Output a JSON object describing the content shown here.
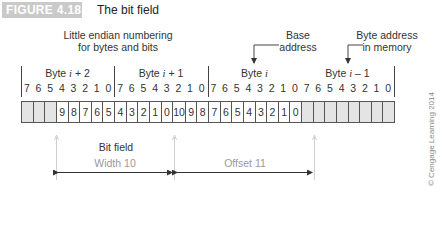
{
  "header": {
    "figure_label": "FIGURE 4.18",
    "title": "The bit field",
    "badge_color": "#c9c9c9"
  },
  "annotations": {
    "numbering_note_line1": "Little endian numbering",
    "numbering_note_line2": "for bytes and bits",
    "base_address_line1": "Base",
    "base_address_line2": "address",
    "byte_address_line1": "Byte address",
    "byte_address_line2": "in memory",
    "bit_field_label": "Bit field",
    "width_label": "Width 10",
    "offset_label": "Offset 11",
    "copyright": "© Cengage Learning 2014"
  },
  "bytes": [
    {
      "prefix": "Byte ",
      "var": "i",
      "suffix": " + 2"
    },
    {
      "prefix": "Byte ",
      "var": "i",
      "suffix": " + 1"
    },
    {
      "prefix": "Byte ",
      "var": "i",
      "suffix": ""
    },
    {
      "prefix": "Byte ",
      "var": "i",
      "suffix": " – 1"
    }
  ],
  "bit_numbers": [
    "7",
    "6",
    "5",
    "4",
    "3",
    "2",
    "1",
    "0",
    "7",
    "6",
    "5",
    "4",
    "3",
    "2",
    "1",
    "0",
    "7",
    "6",
    "5",
    "4",
    "3",
    "2",
    "1",
    "0",
    "7",
    "6",
    "5",
    "4",
    "3",
    "2",
    "1",
    "0"
  ],
  "cells": [
    {
      "v": "",
      "shaded": true
    },
    {
      "v": "",
      "shaded": true
    },
    {
      "v": "",
      "shaded": true
    },
    {
      "v": "9",
      "shaded": false
    },
    {
      "v": "8",
      "shaded": false
    },
    {
      "v": "7",
      "shaded": false
    },
    {
      "v": "6",
      "shaded": false
    },
    {
      "v": "5",
      "shaded": false
    },
    {
      "v": "4",
      "shaded": false
    },
    {
      "v": "3",
      "shaded": false
    },
    {
      "v": "2",
      "shaded": false
    },
    {
      "v": "1",
      "shaded": false
    },
    {
      "v": "0",
      "shaded": false
    },
    {
      "v": "10",
      "shaded": false
    },
    {
      "v": "9",
      "shaded": false
    },
    {
      "v": "8",
      "shaded": false
    },
    {
      "v": "7",
      "shaded": false
    },
    {
      "v": "6",
      "shaded": false
    },
    {
      "v": "5",
      "shaded": false
    },
    {
      "v": "4",
      "shaded": false
    },
    {
      "v": "3",
      "shaded": false
    },
    {
      "v": "2",
      "shaded": false
    },
    {
      "v": "1",
      "shaded": false
    },
    {
      "v": "0",
      "shaded": false
    },
    {
      "v": "",
      "shaded": true
    },
    {
      "v": "",
      "shaded": true
    },
    {
      "v": "",
      "shaded": true
    },
    {
      "v": "",
      "shaded": true
    },
    {
      "v": "",
      "shaded": true
    },
    {
      "v": "",
      "shaded": true
    },
    {
      "v": "",
      "shaded": true
    },
    {
      "v": "",
      "shaded": true
    }
  ]
}
